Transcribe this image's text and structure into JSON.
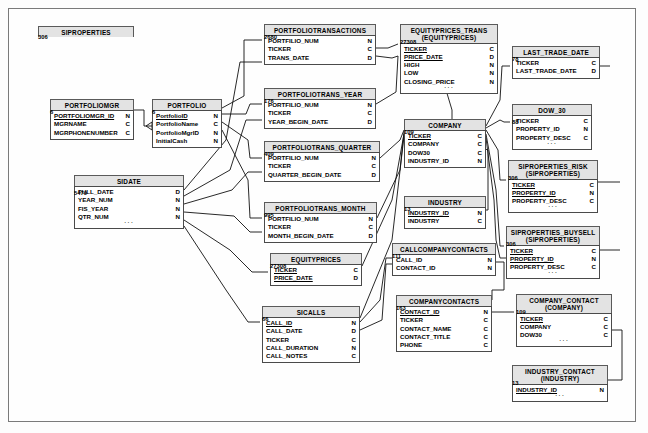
{
  "diagram": {
    "type": "entity-relationship-diagram",
    "type_legend": {
      "C": "Character",
      "N": "Numeric",
      "D": "Date"
    },
    "entities": [
      {
        "id": "siproperties",
        "name": "SIPROPERTIES",
        "subtitle": "",
        "attributes": [],
        "count": "306",
        "x": 38,
        "y": 26,
        "w": 96
      },
      {
        "id": "portfoliomgr",
        "name": "PORTFOLIOMGR",
        "subtitle": "",
        "attributes": [
          {
            "name": "PORTFOLIOMGR_ID",
            "type": "N",
            "key": true
          },
          {
            "name": "MGRNAME",
            "type": "C",
            "key": false
          },
          {
            "name": "MGRPHONENUMBER",
            "type": "C",
            "key": false
          }
        ],
        "ellipsis": false,
        "count": "6",
        "x": 50,
        "y": 99,
        "w": 84
      },
      {
        "id": "portfolio",
        "name": "PORTFOLIO",
        "subtitle": "",
        "attributes": [
          {
            "name": "PortfolioID",
            "type": "N",
            "key": true
          },
          {
            "name": "PortfolioName",
            "type": "C",
            "key": false
          },
          {
            "name": "PortfolioMgrID",
            "type": "N",
            "key": false
          },
          {
            "name": "InitialCash",
            "type": "N",
            "key": false
          }
        ],
        "ellipsis": false,
        "count": "6",
        "x": 152,
        "y": 99,
        "w": 70
      },
      {
        "id": "sidate",
        "name": "SIDATE",
        "subtitle": "",
        "attributes": [
          {
            "name": "FULL_DATE",
            "type": "D",
            "key": false
          },
          {
            "name": "YEAR_NUM",
            "type": "N",
            "key": false
          },
          {
            "name": "FIS_YEAR",
            "type": "N",
            "key": false
          },
          {
            "name": "QTR_NUM",
            "type": "N",
            "key": false
          }
        ],
        "ellipsis": true,
        "count": "5479",
        "x": 74,
        "y": 175,
        "w": 110
      },
      {
        "id": "portfoliotransactions",
        "name": "PORTFOLIOTRANSACTIONS",
        "subtitle": "",
        "attributes": [
          {
            "name": "PORTFILIO_NUM",
            "type": "N",
            "key": false
          },
          {
            "name": "TICKER",
            "type": "C",
            "key": false
          },
          {
            "name": "TRANS_DATE",
            "type": "D",
            "key": false
          }
        ],
        "ellipsis": false,
        "count": "2680",
        "x": 264,
        "y": 24,
        "w": 112
      },
      {
        "id": "portfoliotrans_year",
        "name": "PORTFOLIOTRANS_YEAR",
        "subtitle": "",
        "attributes": [
          {
            "name": "PORTFILIO_NUM",
            "type": "N",
            "key": false
          },
          {
            "name": "TICKER",
            "type": "C",
            "key": false
          },
          {
            "name": "YEAR_BEGIN_DATE",
            "type": "D",
            "key": false
          }
        ],
        "ellipsis": false,
        "count": "176",
        "x": 264,
        "y": 88,
        "w": 112
      },
      {
        "id": "portfoliotrans_quarter",
        "name": "PORTFOLIOTRANS_QUARTER",
        "subtitle": "",
        "attributes": [
          {
            "name": "PORTFILIO_NUM",
            "type": "N",
            "key": false
          },
          {
            "name": "TICKER",
            "type": "C",
            "key": false
          },
          {
            "name": "QUARTER_BEGIN_DATE",
            "type": "D",
            "key": false
          }
        ],
        "ellipsis": false,
        "count": "409",
        "x": 264,
        "y": 141,
        "w": 116
      },
      {
        "id": "portfoliotrans_month",
        "name": "PORTFOLIOTRANS_MONTH",
        "subtitle": "",
        "attributes": [
          {
            "name": "PORTFILIO_NUM",
            "type": "N",
            "key": false
          },
          {
            "name": "TICKER",
            "type": "C",
            "key": false
          },
          {
            "name": "MONTH_BEGIN_DATE",
            "type": "D",
            "key": false
          }
        ],
        "ellipsis": false,
        "count": "995",
        "x": 264,
        "y": 202,
        "w": 113
      },
      {
        "id": "equityprices",
        "name": "EQUITYPRICES",
        "subtitle": "",
        "attributes": [
          {
            "name": "TICKER",
            "type": "C",
            "key": true
          },
          {
            "name": "PRICE_DATE",
            "type": "D",
            "key": true
          }
        ],
        "ellipsis": false,
        "count": "27308",
        "x": 270,
        "y": 253,
        "w": 92
      },
      {
        "id": "sicalls",
        "name": "SICALLS",
        "subtitle": "",
        "attributes": [
          {
            "name": "CALL_ID",
            "type": "N",
            "key": true
          },
          {
            "name": "CALL_DATE",
            "type": "D",
            "key": false
          },
          {
            "name": "TICKER",
            "type": "C",
            "key": false
          },
          {
            "name": "CALL_DURATION",
            "type": "N",
            "key": false
          },
          {
            "name": "CALL_NOTES",
            "type": "C",
            "key": false
          }
        ],
        "ellipsis": false,
        "count": "66",
        "x": 262,
        "y": 306,
        "w": 98
      },
      {
        "id": "equityprices_trans",
        "name": "EQUITYPRICES_TRANS",
        "subtitle": "(EQUITYPRICES)",
        "attributes": [
          {
            "name": "TICKER",
            "type": "C",
            "key": true
          },
          {
            "name": "PRICE_DATE",
            "type": "D",
            "key": true
          },
          {
            "name": "HIGH",
            "type": "N",
            "key": false
          },
          {
            "name": "LOW",
            "type": "N",
            "key": false
          },
          {
            "name": "CLOSING_PRICE",
            "type": "N",
            "key": false
          }
        ],
        "ellipsis": true,
        "count": "27308",
        "x": 400,
        "y": 24,
        "w": 98
      },
      {
        "id": "company",
        "name": "COMPANY",
        "subtitle": "",
        "attributes": [
          {
            "name": "TICKER",
            "type": "C",
            "key": true
          },
          {
            "name": "COMPANY",
            "type": "C",
            "key": false
          },
          {
            "name": "DOW30",
            "type": "C",
            "key": false
          },
          {
            "name": "INDUSTRY_ID",
            "type": "N",
            "key": false
          }
        ],
        "ellipsis": false,
        "count": "109",
        "x": 404,
        "y": 119,
        "w": 82
      },
      {
        "id": "industry",
        "name": "INDUSTRY",
        "subtitle": "",
        "attributes": [
          {
            "name": "INDUSTRY_ID",
            "type": "N",
            "key": true
          },
          {
            "name": "INDUSTRY",
            "type": "C",
            "key": false
          }
        ],
        "ellipsis": false,
        "count": "13",
        "x": 404,
        "y": 196,
        "w": 82
      },
      {
        "id": "callcompanycontacts",
        "name": "CALLCOMPANYCONTACTS",
        "subtitle": "",
        "attributes": [
          {
            "name": "CALL_ID",
            "type": "N",
            "key": false
          },
          {
            "name": "CONTACT_ID",
            "type": "N",
            "key": false
          }
        ],
        "ellipsis": false,
        "count": "111",
        "x": 392,
        "y": 243,
        "w": 104
      },
      {
        "id": "companycontacts",
        "name": "COMPANYCONTACTS",
        "subtitle": "",
        "attributes": [
          {
            "name": "CONTACT_ID",
            "type": "N",
            "key": true
          },
          {
            "name": "TICKER",
            "type": "C",
            "key": false
          },
          {
            "name": "CONTACT_NAME",
            "type": "C",
            "key": false
          },
          {
            "name": "CONTACT_TITLE",
            "type": "C",
            "key": false
          },
          {
            "name": "PHONE",
            "type": "C",
            "key": false
          }
        ],
        "ellipsis": false,
        "count": "163",
        "x": 396,
        "y": 295,
        "w": 96
      },
      {
        "id": "last_trade_date",
        "name": "LAST_TRADE_DATE",
        "subtitle": "",
        "attributes": [
          {
            "name": "TICKER",
            "type": "C",
            "key": false
          },
          {
            "name": "LAST_TRADE_DATE",
            "type": "D",
            "key": false
          }
        ],
        "ellipsis": false,
        "count": "78",
        "x": 512,
        "y": 46,
        "w": 88
      },
      {
        "id": "dow_30",
        "name": "DOW_30",
        "subtitle": "",
        "attributes": [
          {
            "name": "TICKER",
            "type": "C",
            "key": false
          },
          {
            "name": "PROPERTY_ID",
            "type": "N",
            "key": false
          },
          {
            "name": "PROPERTY_DESC",
            "type": "C",
            "key": false
          }
        ],
        "ellipsis": true,
        "count": "88",
        "x": 512,
        "y": 104,
        "w": 80
      },
      {
        "id": "siproperties_risk",
        "name": "SIPROPERTIES_RISK",
        "subtitle": "(SIPROPERTIES)",
        "attributes": [
          {
            "name": "TICKER",
            "type": "C",
            "key": true
          },
          {
            "name": "PROPERTY_ID",
            "type": "N",
            "key": true
          },
          {
            "name": "PROPERTY_DESC",
            "type": "C",
            "key": false
          }
        ],
        "ellipsis": true,
        "count": "306",
        "x": 508,
        "y": 160,
        "w": 90
      },
      {
        "id": "siproperties_buysell",
        "name": "SIPROPERTIES_BUYSELL",
        "subtitle": "(SIPROPERTIES)",
        "attributes": [
          {
            "name": "TICKER",
            "type": "C",
            "key": true
          },
          {
            "name": "PROPERTY_ID",
            "type": "N",
            "key": true
          },
          {
            "name": "PROPERTY_DESC",
            "type": "C",
            "key": false
          }
        ],
        "ellipsis": true,
        "count": "306",
        "x": 506,
        "y": 226,
        "w": 94
      },
      {
        "id": "company_contact",
        "name": "COMPANY_CONTACT",
        "subtitle": "(COMPANY)",
        "attributes": [
          {
            "name": "TICKER",
            "type": "C",
            "key": true
          },
          {
            "name": "COMPANY",
            "type": "C",
            "key": false
          },
          {
            "name": "DOW30",
            "type": "C",
            "key": false
          }
        ],
        "ellipsis": true,
        "count": "109",
        "x": 516,
        "y": 294,
        "w": 96
      },
      {
        "id": "industry_contact",
        "name": "INDUSTRY_CONTACT",
        "subtitle": "(INDUSTRY)",
        "attributes": [
          {
            "name": "INDUSTRY_ID",
            "type": "N",
            "key": true
          }
        ],
        "ellipsis": true,
        "count": "13",
        "x": 512,
        "y": 365,
        "w": 96
      }
    ]
  }
}
